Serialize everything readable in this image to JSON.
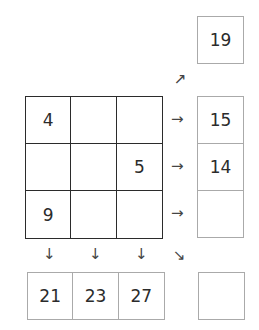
{
  "grid": {
    "cells": [
      "4",
      "",
      "",
      "",
      "",
      "5",
      "9",
      "",
      ""
    ]
  },
  "sums": {
    "diagonal_up": "19",
    "rows": [
      "15",
      "14",
      ""
    ],
    "columns": [
      "21",
      "23",
      "27"
    ],
    "diagonal_down": ""
  },
  "arrows": {
    "right": "→",
    "down": "↓",
    "diag_up": "↗",
    "diag_down": "↘"
  }
}
